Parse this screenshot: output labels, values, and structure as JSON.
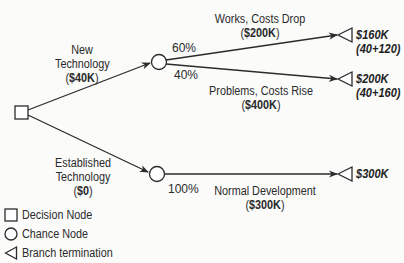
{
  "diagram": {
    "type": "decision-tree",
    "decision_node": {
      "shape": "square"
    },
    "branches": [
      {
        "id": "new-technology",
        "label_line1": "New",
        "label_line2": "Technology",
        "cost_open": "(",
        "cost": "$40K",
        "cost_close": ")",
        "chance_outcomes": [
          {
            "id": "works",
            "probability": "60%",
            "label": "Works, Costs Drop",
            "cost_open": "(",
            "cost": "$200K",
            "cost_close": ")",
            "terminal_value": "$160K",
            "terminal_formula": "(40+120)"
          },
          {
            "id": "problems",
            "probability": "40%",
            "label": "Problems, Costs Rise",
            "cost_open": "(",
            "cost": "$400K",
            "cost_close": ")",
            "terminal_value": "$200K",
            "terminal_formula": "(40+160)"
          }
        ]
      },
      {
        "id": "established-technology",
        "label_line1": "Established",
        "label_line2": "Technology",
        "cost_open": "(",
        "cost": "$0",
        "cost_close": ")",
        "chance_outcomes": [
          {
            "id": "normal",
            "probability": "100%",
            "label": "Normal Development",
            "cost_open": "(",
            "cost": "$300K",
            "cost_close": ")",
            "terminal_value": "$300K"
          }
        ]
      }
    ]
  },
  "legend": {
    "items": [
      {
        "shape": "square",
        "label": "Decision Node"
      },
      {
        "shape": "circle",
        "label": "Chance Node"
      },
      {
        "shape": "triangle-left",
        "label": "Branch termination"
      }
    ]
  },
  "colors": {
    "line": "#2b2b2b",
    "text": "#2a2a2a",
    "background": "#fbfbfa"
  }
}
